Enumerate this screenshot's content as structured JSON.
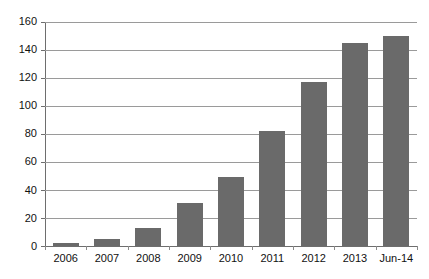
{
  "chart_data": {
    "type": "bar",
    "title": "",
    "subtitle": "",
    "xlabel": "",
    "ylabel": "",
    "categories": [
      "2006",
      "2007",
      "2008",
      "2009",
      "2010",
      "2011",
      "2012",
      "2013",
      "Jun-14"
    ],
    "values": [
      2,
      5,
      13,
      31,
      49,
      82,
      117,
      145,
      150
    ],
    "series": [
      {
        "name": "",
        "values": [
          2,
          5,
          13,
          31,
          49,
          82,
          117,
          145,
          150
        ],
        "color": "#6a6a6a"
      }
    ],
    "ylim": [
      0,
      160
    ],
    "y_ticks": [
      0,
      20,
      40,
      60,
      80,
      100,
      120,
      140,
      160
    ],
    "y_tick_labels": [
      "0",
      "20",
      "40",
      "60",
      "80",
      "100",
      "120",
      "140",
      "160"
    ],
    "grid": true,
    "grid_axis": "y",
    "legend": false,
    "legend_position": "none",
    "bar_color": "#6a6a6a",
    "gridline_color": "#9a9a9a",
    "axis_color": "#6e6e6e",
    "background": "#ffffff"
  }
}
